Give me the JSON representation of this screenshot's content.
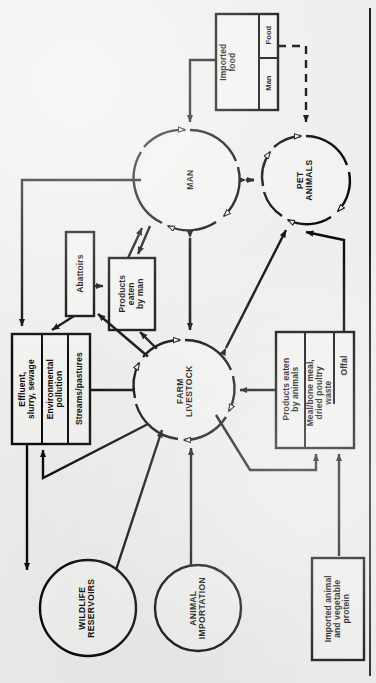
{
  "diagram": {
    "orientation": "rotated-90-counterclockwise",
    "ink_color": "#0b0b0b",
    "paper_color": "#eeeeec"
  },
  "nodes": {
    "man": {
      "label": "MAN",
      "shape": "circle"
    },
    "pet_animals": {
      "label": "PET\nANIMALS",
      "shape": "circle"
    },
    "farm_livestock": {
      "label": "FARM\nLIVESTOCK",
      "shape": "circle"
    },
    "wildlife_reservoirs": {
      "label": "WILDLIFE\nRESERVOIRS",
      "shape": "circle"
    },
    "animal_importation": {
      "label": "ANIMAL\nIMPORTATION",
      "shape": "circle"
    }
  },
  "boxes": {
    "imported_food": {
      "label": "Imported\nfood",
      "compartments": [
        {
          "label": "Food"
        },
        {
          "label": "Man"
        }
      ]
    },
    "abattoirs": {
      "label": "Abattoirs"
    },
    "products_eaten_by_man": {
      "label": "Products\neaten\nby man"
    },
    "environment": {
      "compartments": [
        {
          "label": "Effluent,\nslurry, sewage"
        },
        {
          "label": "Environmental\npollution"
        },
        {
          "label": "Streams/pastures"
        }
      ]
    },
    "animal_feed": {
      "compartments": [
        {
          "label": "Products eaten\nby animals"
        },
        {
          "label": "Meal/bone meal,\ndried poultry\nwaste"
        },
        {
          "label": "Offal"
        }
      ]
    },
    "imported_protein": {
      "label": "Imported animal\nand vegetable\nprotein"
    }
  },
  "edges": [
    {
      "from": "imported_food",
      "to": "man",
      "style": "solid"
    },
    {
      "from": "imported_food.food",
      "to": "pet_animals",
      "style": "dashed"
    },
    {
      "from": "man",
      "to": "pet_animals",
      "style": "solid",
      "arrows": "both"
    },
    {
      "from": "man",
      "to": "farm_livestock",
      "style": "solid",
      "arrows": "both"
    },
    {
      "from": "farm_livestock",
      "to": "pet_animals",
      "style": "solid",
      "arrows": "both"
    },
    {
      "from": "man",
      "to": "environment",
      "style": "solid"
    },
    {
      "from": "abattoirs",
      "to": "products_eaten_by_man",
      "style": "solid"
    },
    {
      "from": "products_eaten_by_man",
      "to": "man",
      "style": "solid",
      "arrows": "both"
    },
    {
      "from": "abattoirs",
      "to": "environment",
      "style": "solid"
    },
    {
      "from": "farm_livestock",
      "to": "abattoirs",
      "style": "solid"
    },
    {
      "from": "environment.streams",
      "to": "farm_livestock",
      "style": "solid"
    },
    {
      "from": "environment",
      "to": "wildlife_reservoirs",
      "style": "solid"
    },
    {
      "from": "wildlife_reservoirs",
      "to": "farm_livestock",
      "style": "solid"
    },
    {
      "from": "animal_importation",
      "to": "farm_livestock",
      "style": "solid"
    },
    {
      "from": "farm_livestock",
      "to": "environment",
      "style": "solid"
    },
    {
      "from": "animal_feed",
      "to": "farm_livestock",
      "style": "solid"
    },
    {
      "from": "animal_feed.offal",
      "to": "pet_animals",
      "style": "solid"
    },
    {
      "from": "abattoirs",
      "to": "animal_feed",
      "style": "solid"
    },
    {
      "from": "imported_protein",
      "to": "animal_feed",
      "style": "solid"
    }
  ]
}
